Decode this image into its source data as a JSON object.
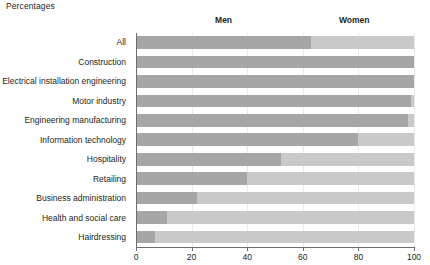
{
  "caption": "Percentages",
  "legend": {
    "men": "Men",
    "women": "Women"
  },
  "axis": {
    "ticks": [
      "0",
      "20",
      "40",
      "60",
      "80",
      "100"
    ]
  },
  "chart_data": {
    "type": "bar",
    "orientation": "horizontal",
    "stacked": true,
    "normalized_percent": true,
    "title": "Percentages",
    "xlabel": "",
    "ylabel": "",
    "xlim": [
      0,
      100
    ],
    "xticks": [
      0,
      20,
      40,
      60,
      80,
      100
    ],
    "grid": "vertical-light",
    "legend": [
      "Men",
      "Women"
    ],
    "legend_position": "top-inside",
    "categories": [
      "All",
      "Construction",
      "Electrical installation engineering",
      "Motor industry",
      "Engineering manufacturing",
      "Information technology",
      "Hospitality",
      "Retailing",
      "Business administration",
      "Health and social care",
      "Hairdressing"
    ],
    "series": [
      {
        "name": "Men",
        "color": "#a6a6a6",
        "values": [
          63,
          100,
          100,
          99,
          98,
          80,
          52,
          40,
          22,
          11,
          7
        ]
      },
      {
        "name": "Women",
        "color": "#c9c9c9",
        "values": [
          37,
          0,
          0,
          1,
          2,
          20,
          48,
          60,
          78,
          89,
          93
        ]
      }
    ]
  }
}
